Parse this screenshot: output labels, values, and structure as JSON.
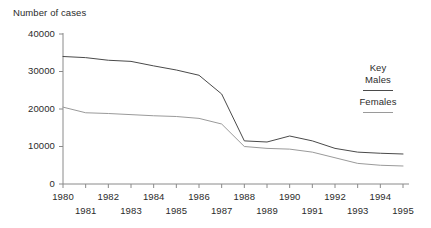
{
  "chart_data": {
    "type": "line",
    "title": "Number of cases",
    "xlabel": "",
    "ylabel": "Number of cases",
    "x": [
      1980,
      1981,
      1982,
      1983,
      1984,
      1985,
      1986,
      1987,
      1988,
      1989,
      1990,
      1991,
      1992,
      1993,
      1994,
      1995
    ],
    "xtick_labels": [
      "1980",
      "1981",
      "1982",
      "1983",
      "1984",
      "1985",
      "1986",
      "1987",
      "1988",
      "1989",
      "1990",
      "1991",
      "1992",
      "1993",
      "1994",
      "1995"
    ],
    "ytick_labels": [
      "0",
      "10000",
      "20000",
      "30000",
      "40000"
    ],
    "ytick_values": [
      0,
      10000,
      20000,
      30000,
      40000
    ],
    "xlim": [
      1980,
      1995
    ],
    "ylim": [
      0,
      40000
    ],
    "grid": false,
    "legend_position": "right",
    "series": [
      {
        "name": "Males",
        "color": "#4a4a4a",
        "values": [
          34000,
          33700,
          33000,
          32700,
          31500,
          30400,
          29000,
          24000,
          11500,
          11200,
          12800,
          11500,
          9500,
          8500,
          8200,
          8000
        ]
      },
      {
        "name": "Females",
        "color": "#9a9a9a",
        "values": [
          20500,
          19000,
          18800,
          18500,
          18200,
          18000,
          17500,
          16000,
          10000,
          9500,
          9300,
          8500,
          7000,
          5500,
          5000,
          4800
        ]
      }
    ]
  },
  "legend": {
    "title": "Key",
    "entries": [
      {
        "label": "Males"
      },
      {
        "label": "Females"
      }
    ]
  },
  "axes": {
    "y_title": "Number of cases"
  },
  "colors": {
    "axis": "#8a8a8a",
    "text": "#2b2b2b",
    "males": "#4a4a4a",
    "females": "#9a9a9a",
    "background": "#ffffff"
  }
}
